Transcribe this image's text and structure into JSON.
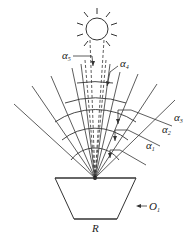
{
  "diagram": {
    "type": "solar-angle-fan",
    "sun": {
      "cx": 97,
      "cy": 29,
      "r": 11,
      "rays": 10
    },
    "origin": {
      "x": 95,
      "y": 178
    },
    "fan_angles_deg": [
      -52,
      -40,
      -28,
      -15,
      -7,
      7,
      15,
      28,
      40,
      52
    ],
    "fan_lengths": [
      150,
      140,
      135,
      128,
      120,
      120,
      128,
      135,
      140,
      150
    ],
    "arc_radii": [
      30,
      52,
      72,
      94,
      118
    ],
    "labels": {
      "alpha5": {
        "base": "α",
        "sub": "5"
      },
      "alpha4": {
        "base": "α",
        "sub": "4"
      },
      "alpha3": {
        "base": "α",
        "sub": "3"
      },
      "alpha2": {
        "base": "α",
        "sub": "2"
      },
      "alpha1": {
        "base": "α",
        "sub": "1"
      },
      "O1": {
        "base": "O",
        "sub": "1"
      },
      "R": {
        "base": "R",
        "sub": ""
      }
    },
    "colors": {
      "stroke": "#333333",
      "background": "#ffffff"
    }
  }
}
